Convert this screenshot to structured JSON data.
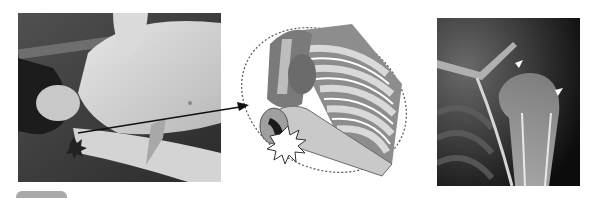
{
  "figure": {
    "panels": [
      {
        "id": "photo",
        "description": "Clinical photo of patient lying supine with arm abducted, grayscale"
      },
      {
        "id": "illustration",
        "description": "Anatomical drawing of shoulder and rib cage inside dashed ellipse with impact burst at humeral head"
      },
      {
        "id": "xray",
        "description": "Shoulder radiograph with two white arrowhead markers on humeral head"
      }
    ],
    "markers": {
      "arrowhead_count": 2,
      "arrowhead_color": "#ffffff"
    },
    "caption": {
      "badge_label": "",
      "text": ""
    }
  },
  "colors": {
    "background": "#ffffff",
    "pointer_line": "#111111",
    "illustration_gray": "#9a9a9a",
    "illustration_dark": "#5a5a5a",
    "burst_dark": "#1a1a1a"
  }
}
